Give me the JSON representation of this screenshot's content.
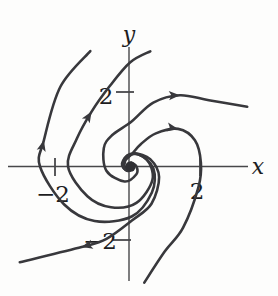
{
  "figure": {
    "kind": "phase portrait of a spiral point",
    "background": "#fdfdfc"
  },
  "chart_data": {
    "type": "line",
    "subtype": "phase-portrait-spiral",
    "xlabel": "x",
    "ylabel": "y",
    "x_ticks": [
      {
        "value": -2,
        "label": "−2"
      },
      {
        "value": 2,
        "label": "2"
      }
    ],
    "y_ticks": [
      {
        "value": -2,
        "label": "−2"
      },
      {
        "value": 2,
        "label": "2"
      }
    ],
    "equilibrium_point": [
      0,
      0
    ],
    "flow_direction": "clockwise, spiraling outward from the origin",
    "style": {
      "curve_color": "#38383c",
      "axis_color": "#47474a",
      "text_color": "#1d1d1f",
      "dot_color": "#303034",
      "curve_width": 2.6,
      "axis_width": 1.4,
      "tick_width": 1.8,
      "arrow_length": 11,
      "arrow_half_width": 4.6
    },
    "px": {
      "width": 278,
      "height": 296,
      "origin": [
        130,
        166.5
      ],
      "x_axis": {
        "x1": 8,
        "y1": 166.5,
        "x2": 248,
        "y2": 166.5
      },
      "y_axis": {
        "x1": 129,
        "y1": 47,
        "x2": 129,
        "y2": 281
      },
      "xlabel_anchor": [
        258,
        174
      ],
      "ylabel_anchor": [
        129,
        42
      ],
      "tick_marks": [
        {
          "axis": "x",
          "value": -2,
          "x1": 55,
          "y1": 158,
          "x2": 55,
          "y2": 176,
          "label_anchor": [
            53,
            202
          ]
        },
        {
          "axis": "x",
          "value": 2,
          "x1": 200,
          "y1": 158,
          "x2": 200,
          "y2": 176,
          "label_anchor": [
            197,
            199
          ]
        },
        {
          "axis": "y",
          "value": 2,
          "x1": 116,
          "y1": 92,
          "x2": 134,
          "y2": 92,
          "label_anchor": [
            106,
            104
          ]
        },
        {
          "axis": "y",
          "value": -2,
          "x1": 113,
          "y1": 240,
          "x2": 131,
          "y2": 240,
          "label_anchor": [
            100,
            249
          ]
        }
      ],
      "equilibrium_dot": {
        "cx": 130.5,
        "cy": 166.5,
        "r": 5.2
      }
    },
    "trajectories": [
      {
        "id": "left-outer",
        "arrow_index": 2,
        "polar_points": [
          [
            109,
            122
          ],
          [
            131,
            106
          ],
          [
            163,
            90
          ],
          [
            180,
            90
          ],
          [
            210,
            76
          ],
          [
            237,
            65
          ],
          [
            272,
            50
          ],
          [
            310,
            34
          ],
          [
            355,
            23.5
          ],
          [
            415,
            15
          ],
          [
            470,
            10.5
          ],
          [
            540,
            7
          ],
          [
            610,
            4.5
          ],
          [
            680,
            3
          ]
        ]
      },
      {
        "id": "left-inner",
        "arrow_index": 3,
        "polar_points": [
          [
            80,
            117
          ],
          [
            90,
            104
          ],
          [
            105,
            82
          ],
          [
            125,
            67
          ],
          [
            152,
            60
          ],
          [
            180,
            62
          ],
          [
            215,
            52
          ],
          [
            245,
            45
          ],
          [
            280,
            37
          ],
          [
            330,
            26
          ],
          [
            385,
            18
          ],
          [
            450,
            12.5
          ],
          [
            520,
            8.5
          ],
          [
            590,
            5.5
          ],
          [
            650,
            3.5
          ]
        ]
      },
      {
        "id": "right-outer",
        "arrow_index": 2,
        "polar_points": [
          [
            27,
            131.5
          ],
          [
            40,
            103
          ],
          [
            55,
            87
          ],
          [
            70,
            68
          ],
          [
            88,
            45
          ],
          [
            120,
            36
          ],
          [
            145,
            32
          ],
          [
            190,
            24
          ],
          [
            250,
            16
          ],
          [
            310,
            10
          ],
          [
            360,
            6.5
          ],
          [
            430,
            4
          ]
        ]
      },
      {
        "id": "right-inner",
        "arrow_index": 6,
        "polar_points": [
          [
            -83,
            117
          ],
          [
            -68,
            92
          ],
          [
            -49,
            81
          ],
          [
            -17,
            71.5
          ],
          [
            3,
            71
          ],
          [
            22,
            70
          ],
          [
            38,
            61
          ],
          [
            52,
            42
          ],
          [
            64,
            25
          ],
          [
            80,
            13
          ],
          [
            130,
            7.5
          ],
          [
            200,
            5
          ],
          [
            260,
            3.5
          ]
        ]
      },
      {
        "id": "bottom-left",
        "arrow_index": 1,
        "polar_points": [
          [
            -139,
            146
          ],
          [
            -121,
            94
          ],
          [
            -108,
            76
          ],
          [
            -88,
            54
          ],
          [
            -60,
            43
          ],
          [
            -20,
            31
          ],
          [
            20,
            21.5
          ],
          [
            70,
            13.5
          ],
          [
            140,
            8.5
          ],
          [
            210,
            5.5
          ],
          [
            270,
            3.5
          ]
        ]
      }
    ]
  }
}
